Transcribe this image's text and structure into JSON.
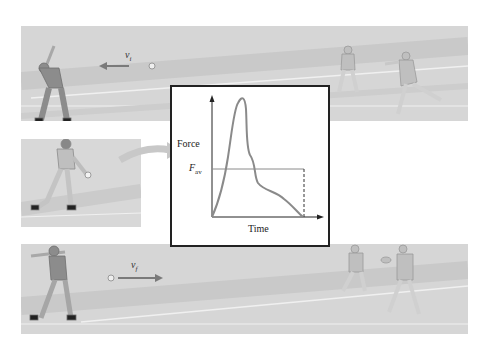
{
  "figure": {
    "panels": [
      {
        "id": "before",
        "velocity_label": "v",
        "velocity_subscript": "i",
        "arrow_direction": "left"
      },
      {
        "id": "contact"
      },
      {
        "id": "after",
        "velocity_label": "v",
        "velocity_subscript": "f",
        "arrow_direction": "right"
      }
    ],
    "graph": {
      "y_axis_label": "Force",
      "x_axis_label": "Time",
      "average_force_label": "F",
      "average_force_subscript": "av"
    },
    "colors": {
      "curve": "#8a8a8a",
      "axis": "#222222",
      "arrow": "#7a7a7a",
      "curved_arrow": "#c8c8c8",
      "panel_bg": "#d8d8d8",
      "field_line": "#f2f2f2"
    }
  }
}
